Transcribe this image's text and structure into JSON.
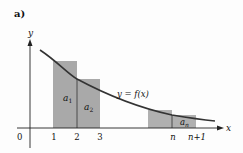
{
  "figure": {
    "panel_label": "a)",
    "axes": {
      "x_label": "x",
      "y_label": "y",
      "origin_label": "0"
    },
    "x_ticks": [
      {
        "label": "1",
        "x": 54
      },
      {
        "label": "2",
        "x": 77
      },
      {
        "label": "3",
        "x": 100
      },
      {
        "label": "n",
        "x": 173
      },
      {
        "label": "n+1",
        "x": 197
      }
    ],
    "curve_label": "y = f(x)",
    "rect_labels": {
      "a1": {
        "base": "a",
        "sub": "1"
      },
      "a2": {
        "base": "a",
        "sub": "2"
      },
      "an": {
        "base": "a",
        "sub": "n"
      }
    },
    "colors": {
      "rect_fill": "#a9a9a9",
      "curve": "#333333",
      "axis": "#222222",
      "text": "#111111"
    }
  }
}
